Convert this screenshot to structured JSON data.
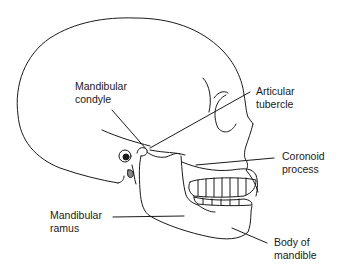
{
  "diagram": {
    "labels": [
      {
        "id": "mandibular-condyle",
        "line1": "Mandibular",
        "line2": "condyle"
      },
      {
        "id": "articular-tubercle",
        "line1": "Articular",
        "line2": "tubercle"
      },
      {
        "id": "coronoid-process",
        "line1": "Coronoid",
        "line2": "process"
      },
      {
        "id": "mandibular-ramus",
        "line1": "Mandibular",
        "line2": "ramus"
      },
      {
        "id": "body-of-mandible",
        "line1": "Body of",
        "line2": "mandible"
      }
    ],
    "colors": {
      "stroke": "#1a1a1a",
      "background": "#ffffff"
    }
  }
}
